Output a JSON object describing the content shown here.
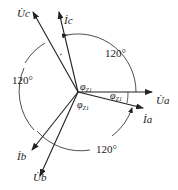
{
  "diagram": {
    "colors": {
      "stroke": "#222222",
      "background": "#ffffff"
    },
    "origin": {
      "x": 78,
      "y": 92
    },
    "phasors": [
      {
        "id": "Ua",
        "label": "U",
        "sub": "a",
        "x2": 152,
        "y2": 92
      },
      {
        "id": "Ia",
        "label": "I",
        "sub": "a",
        "x2": 143,
        "y2": 108
      },
      {
        "id": "Uc",
        "label": "U",
        "sub": "c",
        "x2": 33,
        "y2": 12
      },
      {
        "id": "Ic",
        "label": "I",
        "sub": "c",
        "x2": 59,
        "y2": 12
      },
      {
        "id": "Ub",
        "label": "U",
        "sub": "b",
        "x2": 40,
        "y2": 176
      },
      {
        "id": "Ib",
        "label": "I",
        "sub": "b",
        "x2": 32,
        "y2": 150
      }
    ],
    "angle_labels": [
      {
        "text": "120°",
        "x": 128,
        "y": 56
      },
      {
        "text": "120°",
        "x": 14,
        "y": 84
      },
      {
        "text": "120°",
        "x": 95,
        "y": 151
      }
    ],
    "phi_labels": [
      {
        "text": "φ",
        "sub": "Z1",
        "x": 80,
        "y": 88
      },
      {
        "text": "φ",
        "sub": "Z1",
        "x": 110,
        "y": 98
      },
      {
        "text": "φ",
        "sub": "Z1",
        "x": 78,
        "y": 106
      }
    ],
    "phasor_labels": {
      "Uc": "U̇c",
      "Ic": "İc",
      "Ua": "U̇a",
      "Ia": "İa",
      "Ub": "U̇b",
      "Ib": "İb"
    }
  }
}
